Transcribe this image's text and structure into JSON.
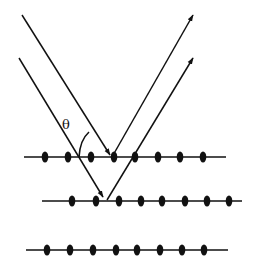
{
  "diagram": {
    "label": "θ",
    "label_pos": [
      62,
      117
    ],
    "colors": {
      "line": "#111111",
      "dot": "#111111",
      "background": "#ffffff"
    },
    "planes": [
      {
        "y": 157,
        "x1": 24,
        "x2": 226,
        "atoms": [
          45,
          68,
          91,
          114,
          135,
          158,
          180,
          203
        ]
      },
      {
        "y": 201,
        "x1": 42,
        "x2": 242,
        "atoms": [
          72,
          96,
          119,
          141,
          162,
          185,
          207,
          229
        ]
      },
      {
        "y": 250,
        "x1": 26,
        "x2": 228,
        "atoms": [
          47,
          70,
          93,
          116,
          137,
          160,
          182,
          204
        ]
      }
    ],
    "incident_rays": [
      {
        "from": [
          22,
          15
        ],
        "to": [
          110,
          155
        ]
      },
      {
        "from": [
          19,
          58
        ],
        "to": [
          103,
          197
        ]
      }
    ],
    "reflected_rays": [
      {
        "from": [
          112,
          157
        ],
        "to": [
          193,
          15
        ]
      },
      {
        "from": [
          107,
          200
        ],
        "to": [
          193,
          58
        ]
      }
    ]
  }
}
